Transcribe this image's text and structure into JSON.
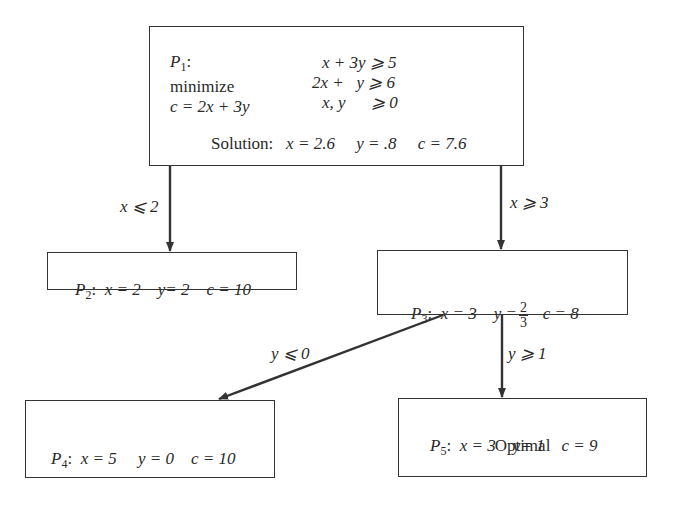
{
  "diagram": {
    "type": "branch-and-bound tree",
    "nodes": {
      "p1": {
        "name": "P",
        "index": "1",
        "sep": ":",
        "objective_label": "minimize",
        "objective": "c = 2x + 3y",
        "constraints": [
          "x + 3y ⩾ 5",
          "2x +   y ⩾ 6",
          "x, y      ⩾ 0"
        ],
        "solution_label": "Solution:",
        "solution": {
          "x": "x = 2.6",
          "y": "y = .8",
          "c": "c = 7.6"
        }
      },
      "p2": {
        "name": "P",
        "index": "2",
        "sep": ":",
        "x": "x = 2",
        "y": "y= 2",
        "c": "c = 10"
      },
      "p3": {
        "name": "P",
        "index": "3",
        "sep": ":",
        "x": "x = 3",
        "y_prefix": "y =",
        "y_num": "2",
        "y_den": "3",
        "c": "c = 8"
      },
      "p4": {
        "name": "P",
        "index": "4",
        "sep": ":",
        "x": "x = 5",
        "y": "y = 0",
        "c": "c = 10"
      },
      "p5": {
        "name": "P",
        "index": "5",
        "sep": ":",
        "x": "x = 3",
        "y": "y= 1",
        "c": "c = 9",
        "status": "Optimal"
      }
    },
    "edges": [
      {
        "from": "p1",
        "to": "p2",
        "label": "x ⩽ 2"
      },
      {
        "from": "p1",
        "to": "p3",
        "label": "x ⩾ 3"
      },
      {
        "from": "p3",
        "to": "p4",
        "label": "y ⩽ 0"
      },
      {
        "from": "p3",
        "to": "p5",
        "label": "y ⩾ 1"
      }
    ],
    "colors": {
      "line": "#333333",
      "text": "#2a2a2a",
      "background": "#ffffff"
    }
  }
}
